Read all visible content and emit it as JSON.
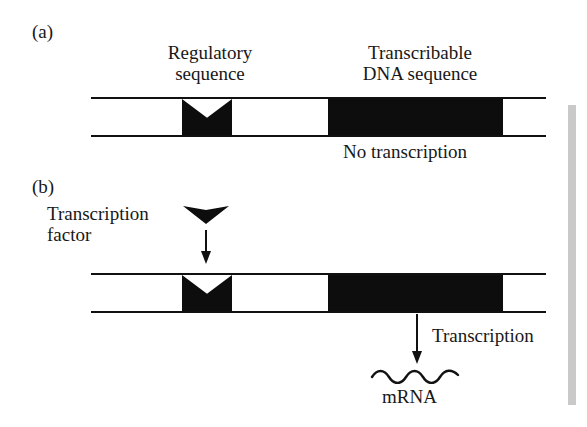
{
  "figure": {
    "background_color": "#ffffff",
    "ink_color": "#0d0d0d",
    "edge_bar_color": "#c9c9c9"
  },
  "panel_a": {
    "label": "(a)",
    "regulatory_label_line1": "Regulatory",
    "regulatory_label_line2": "sequence",
    "transcribable_label_line1": "Transcribable",
    "transcribable_label_line2": "DNA sequence",
    "status": "No transcription"
  },
  "panel_b": {
    "label": "(b)",
    "factor_label_line1": "Transcription",
    "factor_label_line2": "factor",
    "process_label": "Transcription",
    "product_label": "mRNA"
  },
  "icons": {
    "transcription_factor": "down-triangle-icon",
    "binding_arrow": "down-arrow-icon",
    "transcription_arrow": "down-arrow-icon",
    "mrna_strand": "wavy-line-icon",
    "dna_duplex": "double-rail-icon"
  }
}
